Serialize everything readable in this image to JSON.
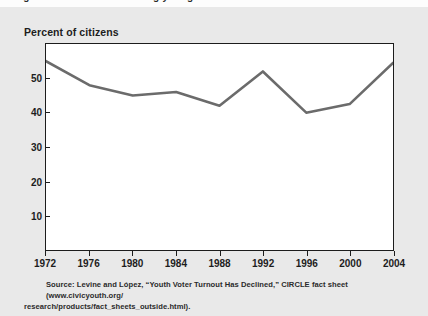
{
  "page": {
    "top_cropped_text": "Figure 1  Voter turnout among young citizens",
    "background_color": "#e9e9e9"
  },
  "figure": {
    "axis_title": "Percent of citizens",
    "source_line_1": "Source:  Levine and López, “Youth Voter Turnout Has Declined,” CIRCLE fact sheet (www.civicyouth.org/",
    "source_line_2": "research/products/fact_sheets_outside.html)."
  },
  "chart_data": {
    "type": "line",
    "title": "",
    "subtitle": "",
    "xlabel": "",
    "ylabel": "Percent of citizens",
    "x": [
      1972,
      1976,
      1980,
      1984,
      1988,
      1992,
      1996,
      2000,
      2004
    ],
    "categories": [
      "1972",
      "1976",
      "1980",
      "1984",
      "1988",
      "1992",
      "1996",
      "2000",
      "2004"
    ],
    "values": [
      55,
      48,
      45,
      46,
      42,
      52,
      40,
      42.5,
      54.5
    ],
    "series": [
      {
        "name": "Voter turnout among young citizens",
        "values": [
          55,
          48,
          45,
          46,
          42,
          52,
          40,
          42.5,
          54.5
        ],
        "color": "#6b6b6b"
      }
    ],
    "xlim": [
      1972,
      2004
    ],
    "ylim": [
      0,
      60
    ],
    "xticks": [
      1972,
      1976,
      1980,
      1984,
      1988,
      1992,
      1996,
      2000,
      2004
    ],
    "yticks": [
      10,
      20,
      30,
      40,
      50
    ],
    "ytick_labels": [
      "10",
      "20",
      "30",
      "40",
      "50"
    ],
    "grid": false,
    "legend": false,
    "line_color": "#6b6b6b",
    "frame_color": "#1c1c1c",
    "plot_background": "#ffffff"
  }
}
